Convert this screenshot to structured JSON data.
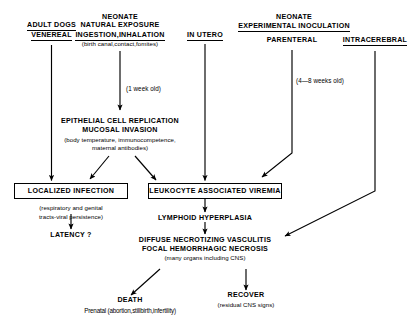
{
  "diagram": {
    "route_headers": {
      "adult_dogs": "ADULT DOGS",
      "venereal": "VENEREAL",
      "neonate_natural_line1": "NEONATE",
      "neonate_natural_line2": "NATURAL EXPOSURE",
      "ingestion_inhalation": "INGESTION,INHALATION",
      "ingestion_detail": "(birth canal,contact,fomites)",
      "in_utero": "IN UTERO",
      "neonate_experimental_line1": "NEONATE",
      "neonate_experimental_line2": "EXPERIMENTAL INOCULATION",
      "parenteral": "PARENTERAL",
      "intracerebral": "INTRACEREBRAL"
    },
    "timing_labels": {
      "one_week": "(1 week old)",
      "four_to_eight_weeks": "(4—8 weeks old)"
    },
    "nodes": {
      "epithelial": {
        "line1": "EPITHELIAL CELL REPLICATION",
        "line2": "MUCOSAL INVASION",
        "line3": "(body temperature, immunocompetence,",
        "line4": "maternal antibodies)"
      },
      "localized_infection": {
        "label": "LOCALIZED INFECTION",
        "detail_line1": "(respiratory and genital",
        "detail_line2": "tracts-viral persistence)"
      },
      "latency": {
        "label": "LATENCY ?"
      },
      "viremia": {
        "label": "LEUKOCYTE ASSOCIATED VIREMIA"
      },
      "lymphoid": {
        "label": "LYMPHOID HYPERPLASIA"
      },
      "vasculitis": {
        "line1": "DIFFUSE NECROTIZING VASCULITIS",
        "line2": "FOCAL HEMORRHAGIC NECROSIS",
        "line3": "(many organs including CNS)"
      },
      "death": {
        "label": "DEATH",
        "detail": "Prenatal (abortion,stillbirth,infertility)"
      },
      "recover": {
        "label": "RECOVER",
        "detail": "(residual CNS signs)"
      }
    },
    "colors": {
      "ink": "#000000",
      "paper": "#ffffff"
    }
  }
}
